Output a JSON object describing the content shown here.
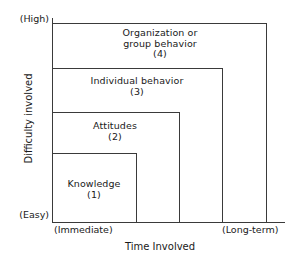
{
  "chart_data": {
    "type": "bar",
    "title": "",
    "xlabel": "Time Involved",
    "ylabel": "Difficulty involved",
    "x_tick_labels": [
      "(Immediate)",
      "(Long-term)"
    ],
    "y_tick_labels": [
      "(Easy)",
      "(High)"
    ],
    "grid": false,
    "legend": "none",
    "note": "Nested step-boxes: each level extends further in both time and difficulty.",
    "categories": [
      "Knowledge",
      "Attitudes",
      "Individual behavior",
      "Organization or group behavior"
    ],
    "series": [
      {
        "name": "Time Involved",
        "values": [
          1,
          2,
          3,
          4
        ]
      },
      {
        "name": "Difficulty involved",
        "values": [
          1,
          2,
          3,
          4
        ]
      }
    ],
    "levels": [
      {
        "number": "(1)",
        "label": "Knowledge",
        "time": 1,
        "difficulty": 1
      },
      {
        "number": "(2)",
        "label": "Attitudes",
        "time": 2,
        "difficulty": 2
      },
      {
        "number": "(3)",
        "label": "Individual behavior",
        "time": 3,
        "difficulty": 3
      },
      {
        "number": "(4)",
        "label": "Organization or group behavior",
        "time": 4,
        "difficulty": 4
      }
    ]
  },
  "axes": {
    "y_title": "Difficulty involved",
    "x_title": "Time Involved",
    "y_top_label": "(High)",
    "y_bottom_label": "(Easy)",
    "x_left_label": "(Immediate)",
    "x_right_label": "(Long-term)"
  },
  "boxes": {
    "level4": {
      "line1": "Organization or",
      "line2": "group behavior",
      "number": "(4)"
    },
    "level3": {
      "line1": "Individual behavior",
      "number": "(3)"
    },
    "level2": {
      "line1": "Attitudes",
      "number": "(2)"
    },
    "level1": {
      "line1": "Knowledge",
      "number": "(1)"
    }
  },
  "colors": {
    "line": "#3a3a3a",
    "text": "#1a1a1a",
    "background": "#ffffff"
  }
}
